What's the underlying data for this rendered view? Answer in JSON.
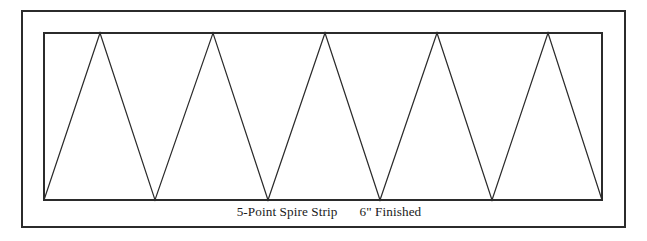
{
  "figure": {
    "background_color": "#ffffff",
    "line_color": "#2b2b2b",
    "outer_frame": {
      "name": "outer-border",
      "x": 22,
      "y": 11,
      "width": 603,
      "height": 216,
      "stroke_width": 1.6
    },
    "inner_frame": {
      "name": "strip-rectangle",
      "x": 44,
      "y": 33,
      "width": 558,
      "height": 167,
      "stroke_width": 1.6
    },
    "zigzag": {
      "name": "five-point-spire-zigzag",
      "point_count": 5,
      "apex_y": 33,
      "base_y": 200,
      "apex_x": [
        100,
        213,
        325,
        437,
        548
      ],
      "valley_x": [
        44,
        155,
        268,
        380,
        492,
        602
      ],
      "stroke_width": 1.2,
      "path": "M 44 200 L 100 33 L 155 200 L 213 33 L 268 200 L 325 33 L 380 200 L 437 33 L 492 200 L 548 33 L 602 200"
    },
    "caption": {
      "name": "strip-caption",
      "primary_label": "5-Point Spire Strip",
      "secondary_label": "6\" Finished",
      "full_text": "5-Point Spire Strip      6\" Finished",
      "x": 329,
      "baseline_y": 216,
      "font_size_px": 13.2,
      "color": "#1a1a1a"
    }
  }
}
